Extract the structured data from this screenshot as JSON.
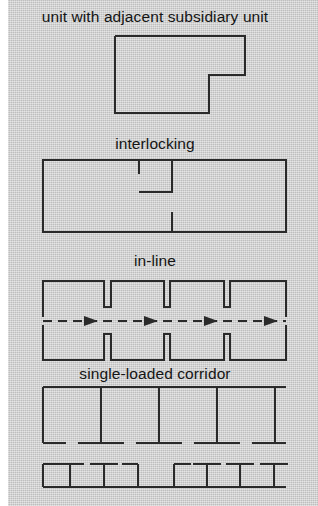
{
  "page": {
    "width": 318,
    "height": 506,
    "background_color": "#ffffff",
    "paper_color": "#cdcdcd",
    "ink_color": "#2a2a2a",
    "text_color": "#141414"
  },
  "figures": [
    {
      "id": "unit-with-adjacent-subsidiary-unit",
      "caption": "unit with adjacent subsidiary unit",
      "caption_y": 8,
      "description": "L-shaped plan outline: large rectangle with a notch removed from the lower right corner",
      "shape": {
        "type": "polygon-outline",
        "points": "115,36 245,36 245,75 209,75 209,113 115,113"
      }
    },
    {
      "id": "interlocking",
      "caption": "interlocking",
      "caption_y": 135,
      "description": "Rectangle subdivided by a vertical wall with interlocking stub walls forming an H / offset junction",
      "shape": {
        "type": "rect-with-internal-walls",
        "outer": "43,160 286,160 286,232 43,232",
        "walls": [
          "139,160 139,173",
          "172,160 172,232",
          "139,192 172,192",
          "172,212 172,232"
        ]
      }
    },
    {
      "id": "in-line",
      "caption": "in-line",
      "caption_y": 252,
      "description": "Two mirrored comb-shaped walls with repeated notches and a dashed circulation axis with arrows between them",
      "shape": {
        "type": "mirrored-comb-with-circulation-axis",
        "top_comb": "43,320 43,283 104,283 104,311 111,311 111,283 164,283 164,311 170,311 170,283 224,283 224,311 230,283 230,283 286,283 286,320",
        "axis_y": 311,
        "arrow_count": 4
      }
    },
    {
      "id": "single-loaded-corridor",
      "caption": "single-loaded corridor",
      "caption_y": 365,
      "description": "Row of rooms opening onto a corridor, with a separate lower strip of T-shaped partition walls",
      "shape": {
        "type": "room-row-plus-partition-strip",
        "top_line": "43,387 286,387",
        "room_dividers_x": [
          43,
          101,
          159,
          217,
          275
        ],
        "divider_bottom_y": 443,
        "strip_baseline_y": 487
      }
    }
  ]
}
